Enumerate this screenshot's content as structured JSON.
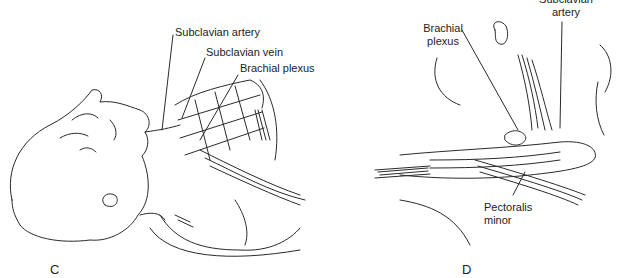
{
  "panels": [
    {
      "id": "C",
      "letter": "C",
      "labels": {
        "subclavian_artery": "Subclavian artery",
        "subclavian_vein": "Subclavian vein",
        "brachial_plexus": "Brachial plexus"
      }
    },
    {
      "id": "D",
      "letter": "D",
      "labels": {
        "subclavian_artery_line1": "Subclavian",
        "subclavian_artery_line2": "artery",
        "brachial_plexus_line1": "Brachial",
        "brachial_plexus_line2": "plexus",
        "pectoralis_minor_line1": "Pectoralis",
        "pectoralis_minor_line2": "minor"
      }
    }
  ],
  "colors": {
    "line": "#2a2a2a",
    "background": "#ffffff"
  }
}
